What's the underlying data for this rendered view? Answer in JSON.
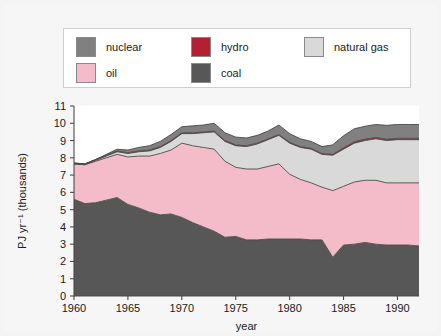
{
  "legend": {
    "entries": [
      {
        "label": "nuclear",
        "color": "#808080",
        "row": 0,
        "x": 12
      },
      {
        "label": "hydro",
        "color": "#b51f32",
        "row": 0,
        "x": 127
      },
      {
        "label": "natural gas",
        "color": "#d9d9d9",
        "row": 0,
        "x": 240
      },
      {
        "label": "oil",
        "color": "#f4bcc8",
        "row": 1,
        "x": 12
      },
      {
        "label": "coal",
        "color": "#575757",
        "row": 1,
        "x": 127
      }
    ],
    "border_color": "#cfcfcf",
    "background": "#ffffff"
  },
  "chart_data": {
    "type": "area",
    "stacked": true,
    "title": "",
    "xlabel": "year",
    "ylabel": "PJ yr⁻¹ (thousands)",
    "xlim": [
      1960,
      1992
    ],
    "ylim": [
      0,
      11
    ],
    "xticks": [
      1960,
      1965,
      1970,
      1975,
      1980,
      1985,
      1990
    ],
    "yticks": [
      0,
      1,
      2,
      3,
      4,
      5,
      6,
      7,
      8,
      9,
      10,
      11
    ],
    "grid": true,
    "legend_position": "above-plot",
    "stack_order": [
      "coal",
      "oil",
      "natural gas",
      "hydro",
      "nuclear"
    ],
    "colors": {
      "coal": "#575757",
      "oil": "#f4bcc8",
      "natural gas": "#d9d9d9",
      "hydro": "#b51f32",
      "nuclear": "#808080"
    },
    "x": [
      1960,
      1961,
      1962,
      1963,
      1964,
      1965,
      1966,
      1967,
      1968,
      1969,
      1970,
      1971,
      1972,
      1973,
      1974,
      1975,
      1976,
      1977,
      1978,
      1979,
      1980,
      1981,
      1982,
      1983,
      1984,
      1985,
      1986,
      1987,
      1988,
      1989,
      1990,
      1991,
      1992
    ],
    "series": [
      {
        "name": "coal",
        "values": [
          5.6,
          5.35,
          5.4,
          5.55,
          5.7,
          5.3,
          5.1,
          4.85,
          4.7,
          4.75,
          4.55,
          4.25,
          4.0,
          3.75,
          3.4,
          3.45,
          3.25,
          3.25,
          3.3,
          3.3,
          3.3,
          3.3,
          3.25,
          3.25,
          2.25,
          2.95,
          3.0,
          3.1,
          3.0,
          2.95,
          2.95,
          2.95,
          2.9
        ]
      },
      {
        "name": "oil",
        "values": [
          2.05,
          2.25,
          2.4,
          2.45,
          2.5,
          2.75,
          3.0,
          3.25,
          3.55,
          3.7,
          4.3,
          4.45,
          4.6,
          4.75,
          4.4,
          4.0,
          4.1,
          4.1,
          4.2,
          4.35,
          3.75,
          3.45,
          3.3,
          3.05,
          3.85,
          3.4,
          3.6,
          3.6,
          3.7,
          3.6,
          3.6,
          3.6,
          3.65
        ]
      },
      {
        "name": "natural gas",
        "values": [
          0.0,
          0.0,
          0.05,
          0.1,
          0.15,
          0.2,
          0.25,
          0.3,
          0.35,
          0.5,
          0.55,
          0.7,
          0.85,
          1.0,
          1.15,
          1.25,
          1.3,
          1.45,
          1.55,
          1.65,
          1.8,
          1.85,
          1.95,
          1.9,
          2.05,
          2.15,
          2.25,
          2.3,
          2.4,
          2.45,
          2.5,
          2.5,
          2.5
        ]
      },
      {
        "name": "hydro",
        "values": [
          0.05,
          0.05,
          0.05,
          0.05,
          0.05,
          0.05,
          0.05,
          0.05,
          0.05,
          0.05,
          0.05,
          0.05,
          0.05,
          0.05,
          0.05,
          0.05,
          0.05,
          0.05,
          0.05,
          0.05,
          0.05,
          0.05,
          0.05,
          0.05,
          0.05,
          0.08,
          0.08,
          0.08,
          0.08,
          0.08,
          0.08,
          0.08,
          0.08
        ]
      },
      {
        "name": "nuclear",
        "values": [
          0.0,
          0.0,
          0.0,
          0.05,
          0.1,
          0.15,
          0.2,
          0.25,
          0.3,
          0.35,
          0.35,
          0.4,
          0.4,
          0.45,
          0.45,
          0.45,
          0.45,
          0.45,
          0.45,
          0.55,
          0.5,
          0.45,
          0.4,
          0.4,
          0.55,
          0.7,
          0.75,
          0.75,
          0.75,
          0.8,
          0.8,
          0.8,
          0.8
        ]
      }
    ]
  }
}
